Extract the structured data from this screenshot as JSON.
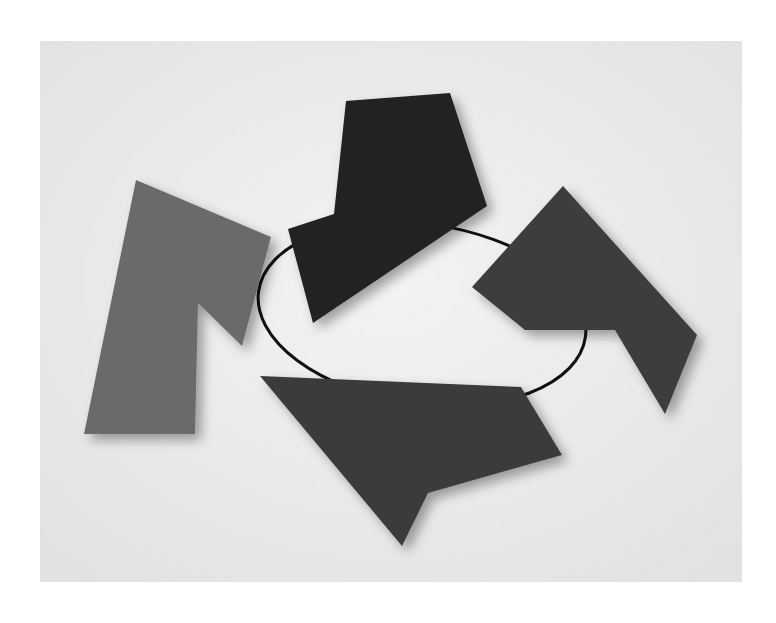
{
  "image": {
    "description": "Photograph of a wall sculpture: four flat polygonal panels in shades of gray and near-black linked by a thin black wire ring, on a light gray background",
    "background_color": "#e9e9e9",
    "wire_color": "#111111",
    "pieces": [
      {
        "name": "left-gray-piece",
        "color": "#6b6b6b",
        "points": "136,180 271,237 242,346 198,303 195,434 84,434"
      },
      {
        "name": "top-black-piece",
        "color": "#202020",
        "points": "346,101 450,93 487,206 313,323 288,229 334,214"
      },
      {
        "name": "right-dark-piece",
        "color": "#3c3c3c",
        "points": "563,186 697,335 665,414 615,330 525,330 472,287"
      },
      {
        "name": "bottom-dark-piece",
        "color": "#3b3b3b",
        "points": "260,376 521,387 562,455 428,493 402,546"
      }
    ],
    "wire": {
      "cx": 422,
      "cy": 314,
      "rx": 165,
      "ry": 90,
      "rotation": 8
    }
  }
}
